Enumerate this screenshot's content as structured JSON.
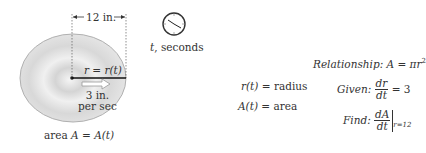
{
  "figure": {
    "dimension_label": "12 in.",
    "radius_label": "r = r(t)",
    "speed_label_line1": "3 in.",
    "speed_label_line2": "per sec",
    "area_label_prefix": "area ",
    "area_label_math": "A = A(t)",
    "clock_caption_var": "t",
    "clock_caption_text": ", seconds"
  },
  "definitions": [
    {
      "symbol": "r(t) =",
      "meaning": "radius"
    },
    {
      "symbol": "A(t) =",
      "meaning": "area"
    }
  ],
  "relationship": {
    "label": "Relationship:",
    "formula": "A = πr",
    "exponent": "2"
  },
  "given": {
    "label": "Given:",
    "num": "dr",
    "den": "dt",
    "rhs": "= 3"
  },
  "find": {
    "label": "Find:",
    "num": "dA",
    "den": "dt",
    "condition": "r=12"
  },
  "colors": {
    "ink": "#333333",
    "disk": "#d9d9d9",
    "disk_edge": "#9a9a9a"
  }
}
